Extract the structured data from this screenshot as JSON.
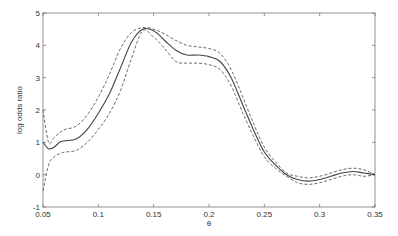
{
  "chart_data": {
    "type": "line",
    "title": "",
    "xlabel": "θ",
    "ylabel": "log odds ratio",
    "xlim": [
      0.05,
      0.35
    ],
    "ylim": [
      -1,
      5
    ],
    "xticks": [
      "0.05",
      "0.1",
      "0.15",
      "0.2",
      "0.25",
      "0.3",
      "0.35"
    ],
    "yticks": [
      "-1",
      "0",
      "1",
      "2",
      "3",
      "4",
      "5"
    ],
    "grid": false,
    "legend": null,
    "x": [
      0.05,
      0.055,
      0.06,
      0.065,
      0.07,
      0.08,
      0.09,
      0.1,
      0.11,
      0.12,
      0.13,
      0.14,
      0.15,
      0.16,
      0.17,
      0.18,
      0.19,
      0.2,
      0.21,
      0.22,
      0.23,
      0.24,
      0.25,
      0.26,
      0.27,
      0.28,
      0.29,
      0.3,
      0.31,
      0.32,
      0.33,
      0.34,
      0.35
    ],
    "series": [
      {
        "name": "estimate",
        "style": "solid",
        "values": [
          1.0,
          0.8,
          0.85,
          1.0,
          1.05,
          1.1,
          1.4,
          1.9,
          2.5,
          3.3,
          4.1,
          4.5,
          4.45,
          4.15,
          3.85,
          3.7,
          3.7,
          3.65,
          3.5,
          3.0,
          2.2,
          1.4,
          0.7,
          0.3,
          0.0,
          -0.15,
          -0.2,
          -0.15,
          -0.05,
          0.05,
          0.1,
          0.05,
          0.0
        ]
      },
      {
        "name": "upper band",
        "style": "dashed",
        "values": [
          2.0,
          1.0,
          1.15,
          1.3,
          1.4,
          1.5,
          1.85,
          2.4,
          3.1,
          3.9,
          4.4,
          4.55,
          4.5,
          4.35,
          4.15,
          4.0,
          3.95,
          3.9,
          3.75,
          3.25,
          2.45,
          1.6,
          0.85,
          0.4,
          0.05,
          -0.05,
          -0.1,
          -0.05,
          0.05,
          0.15,
          0.2,
          0.15,
          0.0
        ]
      },
      {
        "name": "lower band",
        "style": "dashed",
        "values": [
          -0.5,
          0.3,
          0.55,
          0.65,
          0.7,
          0.75,
          1.0,
          1.4,
          1.9,
          2.6,
          3.6,
          4.45,
          4.25,
          3.9,
          3.5,
          3.45,
          3.45,
          3.4,
          3.25,
          2.75,
          1.95,
          1.2,
          0.55,
          0.2,
          -0.05,
          -0.25,
          -0.3,
          -0.25,
          -0.15,
          -0.05,
          0.0,
          -0.05,
          0.0
        ]
      }
    ]
  },
  "colors": {
    "axis": "#666666",
    "line": "#444444",
    "text": "#333333"
  }
}
